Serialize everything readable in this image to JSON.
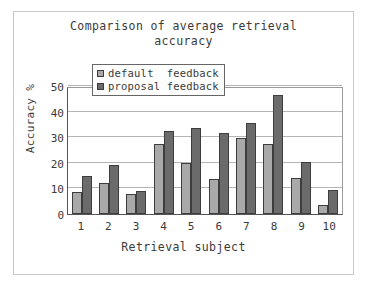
{
  "chart_data": {
    "type": "bar",
    "title": "Comparison of average retrieval\naccuracy",
    "xlabel": "Retrieval subject",
    "ylabel": "Accuracy %",
    "categories": [
      "1",
      "2",
      "3",
      "4",
      "5",
      "6",
      "7",
      "8",
      "9",
      "10"
    ],
    "series": [
      {
        "name": "default  feedback",
        "color": "#a9a9a9",
        "values": [
          8.5,
          12,
          8,
          27.5,
          20,
          13.5,
          29.5,
          27.5,
          14,
          3.5
        ]
      },
      {
        "name": "proposal feedback",
        "color": "#6b6b6b",
        "values": [
          15,
          19,
          9,
          32.5,
          33.5,
          31.5,
          35.5,
          46.5,
          20.5,
          9.5
        ]
      }
    ],
    "ylim": [
      0,
      50
    ],
    "yticks": [
      0,
      10,
      20,
      30,
      40,
      50
    ],
    "ytick_labels": [
      "0",
      "10",
      "20",
      "30",
      "40",
      "50"
    ],
    "grid": true,
    "legend_position": "upper-left-inside"
  },
  "legend": {
    "entries": [
      {
        "label": "default  feedback",
        "swatch": "legend-swatch-default"
      },
      {
        "label": "proposal feedback",
        "swatch": "legend-swatch-proposal"
      }
    ]
  },
  "colors": {
    "series_default": "#a9a9a9",
    "series_proposal": "#6b6b6b",
    "axis": "#555555",
    "grid": "#b5b5b5",
    "text": "#3a3a3a",
    "frame": "#c9c9c9",
    "background": "#ffffff"
  }
}
